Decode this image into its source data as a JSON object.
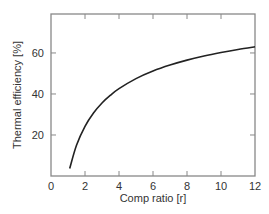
{
  "chart_data": {
    "type": "line",
    "title": "",
    "xlabel": "Comp ratio [r]",
    "ylabel": "Thermal efficiency [%]",
    "xlim": [
      0,
      12
    ],
    "ylim": [
      0,
      79
    ],
    "grid": false,
    "legend": null,
    "x_ticks": [
      0,
      2,
      4,
      6,
      8,
      10,
      12
    ],
    "x_tick_labels": [
      "0",
      "2",
      "4",
      "6",
      "8",
      "10",
      "12"
    ],
    "y_ticks": [
      20,
      40,
      60
    ],
    "y_tick_labels": [
      "20",
      "40",
      "60"
    ],
    "series": [
      {
        "name": "Thermal efficiency",
        "color": "#222222",
        "x": [
          1.1,
          1.5,
          2,
          2.5,
          3,
          3.5,
          4,
          5,
          6,
          7,
          8,
          9,
          10,
          11,
          12
        ],
        "values": [
          3.7,
          15.0,
          24.2,
          30.7,
          35.6,
          39.4,
          42.6,
          47.5,
          51.2,
          54.1,
          56.5,
          58.5,
          60.2,
          61.7,
          63.0
        ]
      }
    ]
  },
  "colors": {
    "frame": "#888888",
    "curve": "#222222",
    "text": "#333333"
  }
}
